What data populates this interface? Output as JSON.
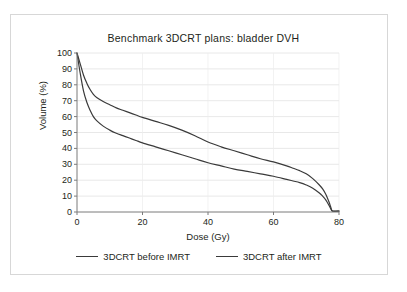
{
  "chart_data": {
    "type": "line",
    "title": "Benchmark 3DCRT plans: bladder DVH",
    "xlabel": "Dose (Gy)",
    "ylabel": "Volume (%)",
    "xlim": [
      0,
      80
    ],
    "ylim": [
      0,
      100
    ],
    "xticks": [
      0,
      20,
      40,
      60,
      80
    ],
    "yticks": [
      0,
      10,
      20,
      30,
      40,
      50,
      60,
      70,
      80,
      90,
      100
    ],
    "grid": "horizontal",
    "legend_position": "bottom",
    "line_color": "#3a3a3a",
    "series": [
      {
        "name": "3DCRT before IMRT",
        "x": [
          0,
          1,
          2,
          3,
          4,
          5,
          6,
          8,
          10,
          12,
          14,
          16,
          18,
          20,
          24,
          28,
          32,
          36,
          40,
          44,
          48,
          52,
          56,
          60,
          64,
          66,
          68,
          70,
          72,
          74,
          75,
          76,
          77,
          77.5,
          78,
          80
        ],
        "values": [
          100,
          93,
          86,
          81,
          77,
          74,
          72,
          69.5,
          67.5,
          65.5,
          64,
          62.5,
          61,
          59.5,
          57,
          54.5,
          51.5,
          48,
          44,
          41,
          38.5,
          36,
          33.5,
          31.5,
          29,
          27.5,
          26,
          24,
          21,
          17,
          14.5,
          11,
          6,
          3,
          0.6,
          0.6
        ]
      },
      {
        "name": "3DCRT after IMRT",
        "x": [
          0,
          1,
          2,
          3,
          4,
          5,
          6,
          8,
          10,
          12,
          14,
          16,
          18,
          20,
          24,
          28,
          32,
          36,
          40,
          44,
          48,
          52,
          56,
          60,
          64,
          66,
          68,
          70,
          72,
          74,
          75,
          76,
          77,
          77.5,
          78,
          80
        ],
        "values": [
          100,
          87,
          76,
          69,
          64,
          60,
          57.5,
          54,
          51.5,
          49.5,
          48,
          46.5,
          45,
          43.5,
          41,
          38.5,
          36,
          33.5,
          31,
          29,
          27,
          25.5,
          24,
          22.5,
          20.5,
          19.5,
          18.5,
          17,
          15,
          12,
          10,
          7.5,
          4,
          2,
          0.6,
          0.6
        ]
      }
    ]
  },
  "legend": {
    "items": [
      {
        "label": "3DCRT before IMRT"
      },
      {
        "label": "3DCRT after IMRT"
      }
    ]
  }
}
